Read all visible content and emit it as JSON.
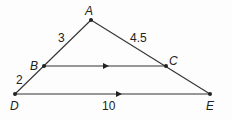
{
  "diagram": {
    "points": {
      "A": {
        "label": "A",
        "x": 91,
        "y": 20
      },
      "B": {
        "label": "B",
        "x": 44,
        "y": 66
      },
      "C": {
        "label": "C",
        "x": 166,
        "y": 66
      },
      "D": {
        "label": "D",
        "x": 15,
        "y": 94
      },
      "E": {
        "label": "E",
        "x": 210,
        "y": 94
      }
    },
    "lengths": {
      "AB": "3",
      "AC": "4.5",
      "BD": "2",
      "DE": "10"
    },
    "parallel_marks": [
      "BC",
      "DE"
    ],
    "line_color": "#333333"
  }
}
